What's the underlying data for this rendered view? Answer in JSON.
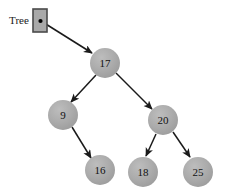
{
  "diagram": {
    "pointer": {
      "label": "Tree",
      "box": {
        "fill": "#a9a9a9",
        "border": "#4a4a4a"
      },
      "dot_color": "#000000"
    },
    "style": {
      "node_fill": "#a9a9a9",
      "node_text": "#111111",
      "edge_color": "#1a1a1a",
      "background": "#ffffff"
    },
    "nodes": [
      {
        "id": "n17",
        "label": "17",
        "cx": 105,
        "cy": 63,
        "r": 15
      },
      {
        "id": "n9",
        "label": "9",
        "cx": 63,
        "cy": 115,
        "r": 15
      },
      {
        "id": "n20",
        "label": "20",
        "cx": 163,
        "cy": 120,
        "r": 15
      },
      {
        "id": "n16",
        "label": "16",
        "cx": 100,
        "cy": 170,
        "r": 15
      },
      {
        "id": "n18",
        "label": "18",
        "cx": 143,
        "cy": 172,
        "r": 15
      },
      {
        "id": "n25",
        "label": "25",
        "cx": 198,
        "cy": 172,
        "r": 15
      }
    ],
    "edges": [
      {
        "id": "e-tree-17",
        "from": "Tree",
        "to": "17",
        "x1": 41,
        "y1": 21,
        "x2": 92,
        "y2": 53
      },
      {
        "id": "e-17-9",
        "from": "17",
        "to": "9",
        "x1": 96,
        "y1": 75,
        "x2": 71,
        "y2": 102
      },
      {
        "id": "e-17-20",
        "from": "17",
        "to": "20",
        "x1": 116,
        "y1": 73,
        "x2": 152,
        "y2": 109
      },
      {
        "id": "e-9-16",
        "from": "9",
        "to": "16",
        "x1": 72,
        "y1": 127,
        "x2": 91,
        "y2": 158
      },
      {
        "id": "e-20-18",
        "from": "20",
        "to": "18",
        "x1": 156,
        "y1": 134,
        "x2": 146,
        "y2": 156
      },
      {
        "id": "e-20-25",
        "from": "20",
        "to": "25",
        "x1": 173,
        "y1": 132,
        "x2": 190,
        "y2": 157
      }
    ]
  }
}
